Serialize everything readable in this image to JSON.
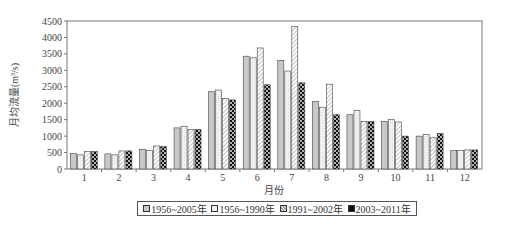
{
  "chart_data": {
    "type": "bar",
    "title": "",
    "xlabel": "月份",
    "ylabel": "月均流量(m³/s)",
    "ylim": [
      0,
      4500
    ],
    "yticks": [
      0,
      500,
      1000,
      1500,
      2000,
      2500,
      3000,
      3500,
      4000,
      4500
    ],
    "grid": false,
    "legend_position": "bottom",
    "categories": [
      "1",
      "2",
      "3",
      "4",
      "5",
      "6",
      "7",
      "8",
      "9",
      "10",
      "11",
      "12"
    ],
    "series": [
      {
        "name": "1956~2005年",
        "pattern": "gray",
        "values": [
          470,
          460,
          600,
          1250,
          2350,
          3430,
          3300,
          2050,
          1650,
          1450,
          1000,
          560
        ]
      },
      {
        "name": "1956~1990年",
        "pattern": "light",
        "values": [
          430,
          430,
          560,
          1300,
          2400,
          3380,
          2980,
          1880,
          1780,
          1500,
          1050,
          560
        ]
      },
      {
        "name": "1991~2002年",
        "pattern": "hatch",
        "values": [
          530,
          550,
          700,
          1200,
          2150,
          3680,
          4330,
          2580,
          1450,
          1430,
          950,
          580
        ]
      },
      {
        "name": "2003~2011年",
        "pattern": "checker",
        "values": [
          530,
          550,
          680,
          1200,
          2100,
          2560,
          2620,
          1650,
          1450,
          1000,
          1080,
          580
        ]
      }
    ]
  }
}
